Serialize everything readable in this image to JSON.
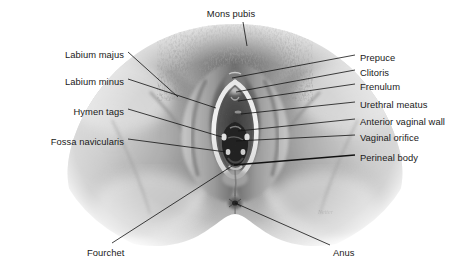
{
  "figure": {
    "background_color": "#ffffff",
    "illustration": {
      "type": "grayscale-medical-illustration",
      "subject": "female perineum, anterior-inferior view",
      "tone_light": "#f2f2f2",
      "tone_mid": "#a8a8a8",
      "tone_dark": "#4a4a4a",
      "tone_darkest": "#1a1a1a"
    },
    "leader_line_color": "#111111",
    "labels": [
      {
        "id": "mons-pubis",
        "text": "Mons pubis",
        "side": "top",
        "x": 231,
        "y": 14,
        "anchor_x": 247,
        "anchor_y": 46
      },
      {
        "id": "labium-majus",
        "text": "Labium majus",
        "side": "left",
        "x": 86,
        "y": 55,
        "anchor_x": 178,
        "anchor_y": 97
      },
      {
        "id": "labium-minus",
        "text": "Labium minus",
        "side": "left",
        "x": 86,
        "y": 82,
        "anchor_x": 216,
        "anchor_y": 108
      },
      {
        "id": "hymen-tags",
        "text": "Hymen tags",
        "side": "left",
        "x": 86,
        "y": 112,
        "anchor_x": 222,
        "anchor_y": 137
      },
      {
        "id": "fossa-navicularis",
        "text": "Fossa navicularis",
        "side": "left",
        "x": 86,
        "y": 142,
        "anchor_x": 226,
        "anchor_y": 152
      },
      {
        "id": "prepuce",
        "text": "Prepuce",
        "side": "right",
        "x": 360,
        "y": 58,
        "anchor_x": 232,
        "anchor_y": 78
      },
      {
        "id": "clitoris",
        "text": "Clitoris",
        "side": "right",
        "x": 360,
        "y": 73,
        "anchor_x": 236,
        "anchor_y": 92
      },
      {
        "id": "frenulum",
        "text": "Frenulum",
        "side": "right",
        "x": 360,
        "y": 87,
        "anchor_x": 238,
        "anchor_y": 101
      },
      {
        "id": "urethral-meatus",
        "text": "Urethral meatus",
        "side": "right",
        "x": 360,
        "y": 105,
        "anchor_x": 241,
        "anchor_y": 114
      },
      {
        "id": "anterior-vaginal-wall",
        "text": "Anterior vaginal wall",
        "side": "right",
        "x": 360,
        "y": 122,
        "anchor_x": 238,
        "anchor_y": 131
      },
      {
        "id": "vaginal-orifice",
        "text": "Vaginal orifice",
        "side": "right",
        "x": 360,
        "y": 138,
        "anchor_x": 236,
        "anchor_y": 141
      },
      {
        "id": "perineal-body",
        "text": "Perineal body",
        "side": "right",
        "x": 360,
        "y": 158,
        "anchor_x": 234,
        "anchor_y": 165
      },
      {
        "id": "fourchet",
        "text": "Fourchet",
        "side": "bottom",
        "x": 87,
        "y": 248,
        "anchor_x": 232,
        "anchor_y": 166
      },
      {
        "id": "anus",
        "text": "Anus",
        "side": "bottom",
        "x": 333,
        "y": 248,
        "anchor_x": 235,
        "anchor_y": 203
      }
    ]
  }
}
